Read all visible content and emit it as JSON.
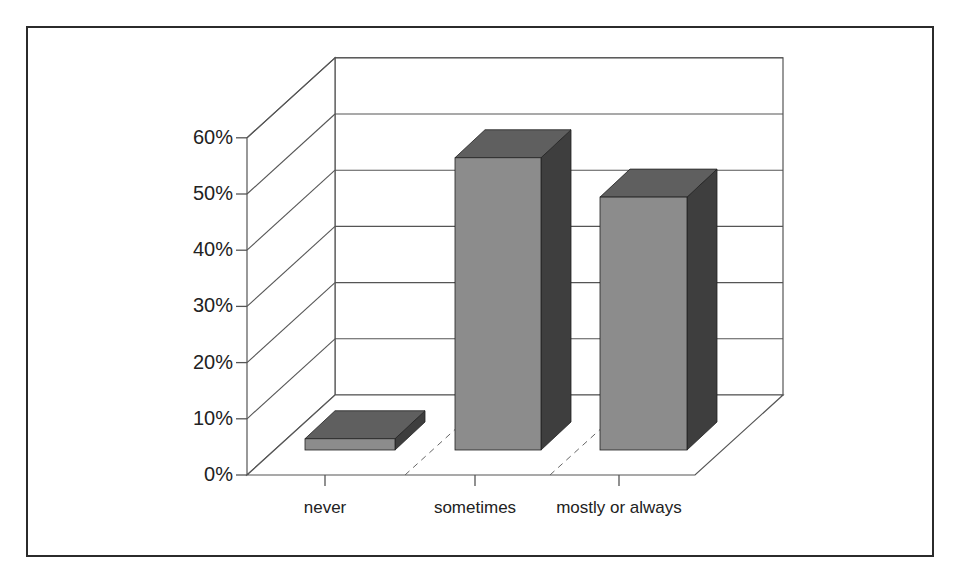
{
  "chart_data": {
    "type": "bar",
    "style": "3d-column",
    "title": "",
    "xlabel": "",
    "ylabel": "",
    "categories": [
      "never",
      "sometimes",
      "mostly or always"
    ],
    "values": [
      2,
      52,
      45
    ],
    "value_unit": "%",
    "ylim": [
      0,
      60
    ],
    "yticks": [
      "0%",
      "10%",
      "20%",
      "30%",
      "40%",
      "50%",
      "60%"
    ],
    "grid": true,
    "legend": null
  },
  "colors": {
    "bar_front": "#8c8c8c",
    "bar_top": "#5f5f5f",
    "bar_side": "#3e3e3e",
    "axis": "#555555",
    "frame": "#2b2b2b"
  }
}
